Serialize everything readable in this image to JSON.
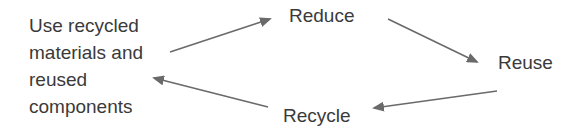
{
  "diagram": {
    "type": "cycle-flow",
    "colors": {
      "text": "#3a3a3a",
      "arrow": "#6a6a6a",
      "background": "#ffffff"
    },
    "nodes": {
      "source": {
        "lines": [
          "Use recycled",
          "materials and",
          "reused",
          "components"
        ]
      },
      "reduce": {
        "label": "Reduce"
      },
      "reuse": {
        "label": "Reuse"
      },
      "recycle": {
        "label": "Recycle"
      }
    },
    "edges": [
      {
        "from": "source",
        "to": "reduce"
      },
      {
        "from": "reduce",
        "to": "reuse"
      },
      {
        "from": "reuse",
        "to": "recycle"
      },
      {
        "from": "recycle",
        "to": "source"
      }
    ]
  }
}
